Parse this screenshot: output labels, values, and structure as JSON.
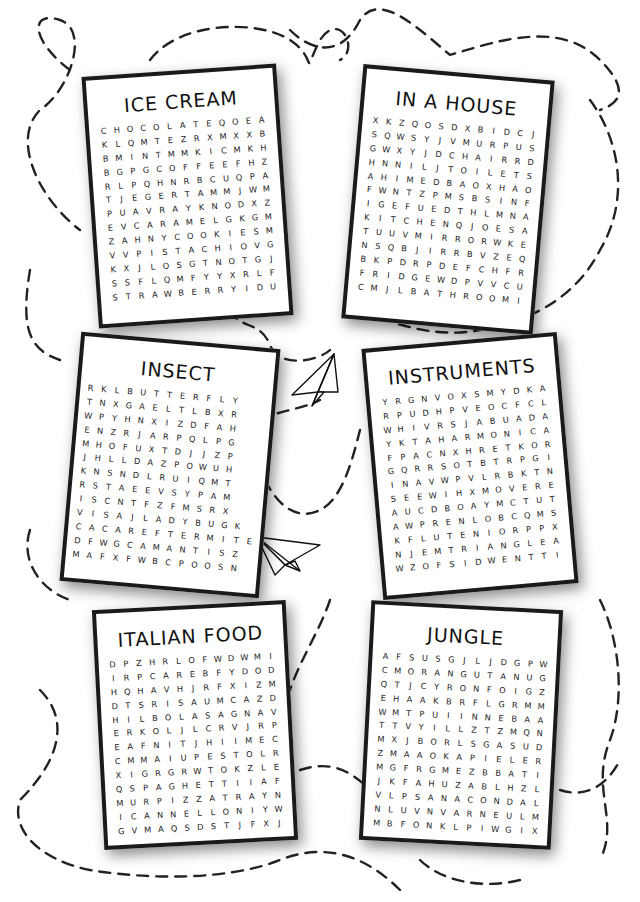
{
  "puzzles": [
    {
      "title": "ICE CREAM",
      "rows": [
        "CHOCOLATEQOEA",
        "KLQMTEZRXMXXB",
        "BMINTMMKICMKH",
        "BGPGCOFFEEFHZ",
        "RLPQHNRBCUQPA",
        "TJEGERTAMMJWM",
        "PUAVRAYKNODXZ",
        "EVCARAMELGKGM",
        "ZAHNYCOOKIESM",
        "VVPISTACHIOVG",
        "KXJLOSGTNOTGJ",
        "SSFLQMFYYXRLF",
        "STRAWBERRYIDU"
      ],
      "words": [
        "CHOCOLATE",
        "MINT",
        "COFFEE",
        "CARAMEL",
        "COOKIES",
        "PISTACHIO",
        "STRAWBERRY",
        "PEACH",
        "VANILLA",
        "LEMON",
        "CONES"
      ]
    },
    {
      "title": "IN A HOUSE",
      "rows": [
        "XKZQOSDXBIDCJ",
        "SQWSYJVMURPUS",
        "GWXYJDCHAIRRD",
        "HNNILJTOILETS",
        "AHIMEDBAOXHAO",
        "FWNTZPMSBSINF",
        "IGEFUEDTHLMNA",
        "KITCHENQJOESA",
        "TUUVMIRRORWKE",
        "NSQBJIRRBVZEQ",
        "BKPDRPDEFCHFR",
        "FRIDGEWDPVVCU",
        "CMJLBATHROOMI"
      ],
      "words": [
        "CHAIR",
        "TOILET",
        "KITCHEN",
        "MIRROR",
        "FRIDGE",
        "BATHROOM",
        "CURTAINS",
        "SOFA",
        "BED",
        "DESK"
      ]
    },
    {
      "title": "INSECT",
      "rows": [
        "RKLBUTTERFLY",
        "TNXGAELTLBXR",
        "WPYHNXIZDFAH",
        "ENZRJARPQLPG",
        "MHOFUXTDJJZP",
        "JHLLDAZPOWUH",
        "KNSNDLRUIQMT",
        "RSTAEEVSYPAM",
        "ISCNTFZFMSRX",
        "VISAJLADYBUGK",
        "CACAREFTERMITE",
        "DFWGCAMANTISZ",
        "MAFXFWBCPOOSN"
      ],
      "words": [
        "BUTTERFLY",
        "GNAT",
        "LADYBUG",
        "TERMITE",
        "MANTIS",
        "SCARAB",
        "HORNET",
        "MOSQUITO",
        "FLEA",
        "CICADA"
      ]
    },
    {
      "title": "INSTRUMENTS",
      "rows": [
        "YRGNVOXSMYDKA",
        "RPUDHPVEOCFCL",
        "WHIVRSJABUADA",
        "YKTAHARMONICA",
        "FPACNXHRETKOR",
        "GQRRSOTBTRPGI",
        "INAVWPVLRBKTN",
        "SEEWIHXMOVERE",
        "AUCDBOAYMCTUT",
        "AWPRENLOBCQMS",
        "KFLUTENIORPPX",
        "NJEMTRIANGLEA",
        "WZOFSIDWENTTI"
      ],
      "words": [
        "GUITAR",
        "HARMONICA",
        "CLARINET",
        "OBOE",
        "FLUTE",
        "TRIANGLE",
        "TROMBONE",
        "TRUMPET",
        "VIOLIN",
        "DRUM",
        "PIANO",
        "SAXOPHONE"
      ]
    },
    {
      "title": "ITALIAN FOOD",
      "rows": [
        "DPZHRLOFWDWMI",
        "IRPCAREBFYDOD",
        "HQHAVHJRFXIZM",
        "DTSRISAUMCAZD",
        "HILBOLASAGNAV",
        "ERKOLJLCRVJRP",
        "EAFNITJHIIMEC",
        "CMMAIUPESTOLR",
        "XIGRGRWTOKZLE",
        "QSPAGHETTIIAF",
        "MURPIZZATRAYN",
        "ICANNELLONIYW",
        "GVMAQSDSTJFXJ"
      ],
      "words": [
        "RAVIOLI",
        "CARBONARA",
        "LASAGNA",
        "PESTO",
        "SPAGHETTI",
        "PIZZA",
        "CANNELLONI",
        "BRUSCHETTA",
        "MOZZARELLA",
        "RISOTTO",
        "TIRAMISU",
        "GNOCCHI"
      ]
    },
    {
      "title": "JUNGLE",
      "rows": [
        "AFSUSGJLJDGPW",
        "CMORANGUTANUG",
        "QTJCYRONFOIGZ",
        "EHAAKBRFLGRMM",
        "WMTPUIINNEBAA",
        "TTVYILLZTZMQN",
        "MXJBORLSGASUD",
        "ZMAAOKAPIELER",
        "MGFRGMEZBBATI",
        "JKFAHUZABLHZL",
        "VLPSANACONDAL",
        "NLUVNVARNEULM",
        "MBFONKLPIWGIX"
      ],
      "words": [
        "ORANGUTAN",
        "OKAPI",
        "ANACONDA",
        "JAGUAR",
        "CAPYBARA",
        "GORILLA",
        "TAPIR",
        "MANDRILL",
        "LEMUR",
        "GIBBON",
        "IGUANA"
      ]
    }
  ],
  "decorations": {
    "paper_plane_count": 2,
    "dashed_path_color": "#222222"
  }
}
